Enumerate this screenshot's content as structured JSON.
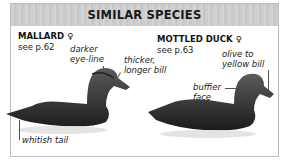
{
  "header": {
    "title": "SIMILAR SPECIES"
  },
  "species": [
    {
      "name": "MALLARD ♀",
      "see": "see p.62",
      "annotations": [
        "darker eye-line",
        "thicker, longer bill",
        "whitish tail"
      ]
    },
    {
      "name": "MOTTLED DUCK ♀",
      "see": "see p.63",
      "annotations": [
        "olive to yellow bill",
        "buffier face"
      ]
    }
  ],
  "labels": {
    "a1l1": "darker",
    "a1l2": "eye-line",
    "a2l1": "thicker,",
    "a2l2": "longer bill",
    "a3": "whitish tail",
    "b1l1": "olive to",
    "b1l2": "yellow bill",
    "b2l1": "buffier",
    "b2l2": "face"
  }
}
